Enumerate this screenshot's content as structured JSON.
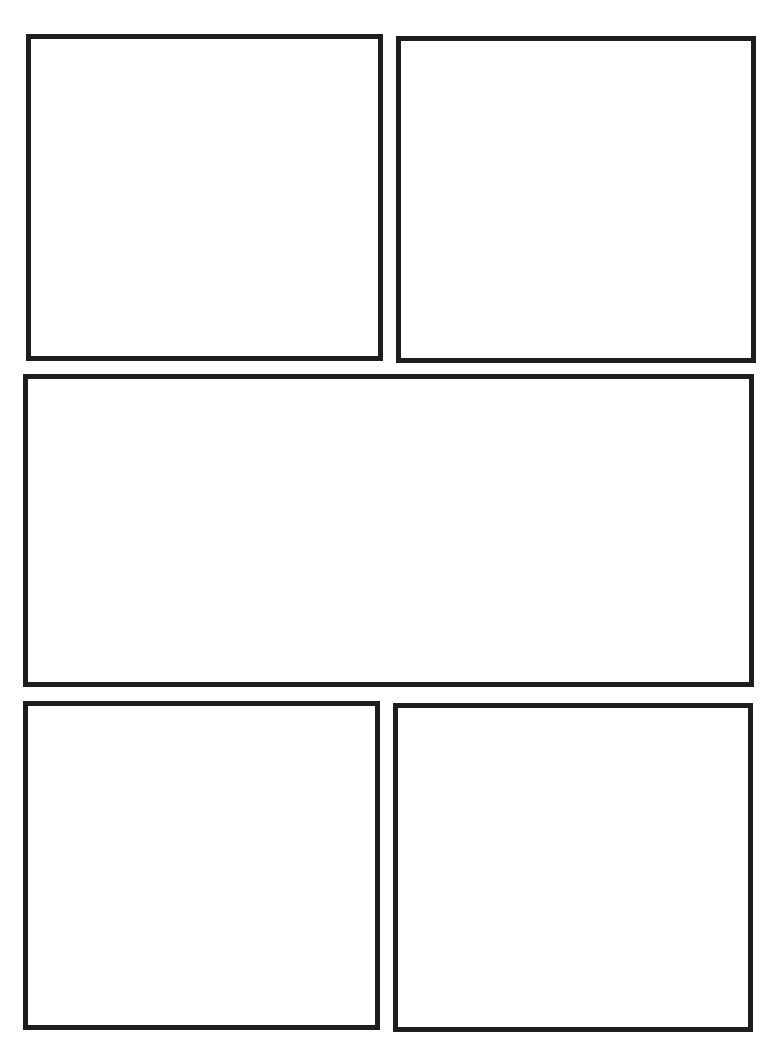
{
  "page": {
    "type": "comic-page-template",
    "background_color": "#ffffff",
    "border_color": "#1e1e1e"
  },
  "panels": [
    {
      "id": "panel-1",
      "row": 1,
      "position": "top-left",
      "left": 26,
      "top": 34,
      "width": 357,
      "height": 327
    },
    {
      "id": "panel-2",
      "row": 1,
      "position": "top-right",
      "left": 396,
      "top": 36,
      "width": 360,
      "height": 327
    },
    {
      "id": "panel-3",
      "row": 2,
      "position": "middle-wide",
      "left": 23,
      "top": 374,
      "width": 731,
      "height": 313
    },
    {
      "id": "panel-4",
      "row": 3,
      "position": "bottom-left",
      "left": 23,
      "top": 701,
      "width": 357,
      "height": 329
    },
    {
      "id": "panel-5",
      "row": 3,
      "position": "bottom-right",
      "left": 393,
      "top": 703,
      "width": 360,
      "height": 329
    }
  ]
}
